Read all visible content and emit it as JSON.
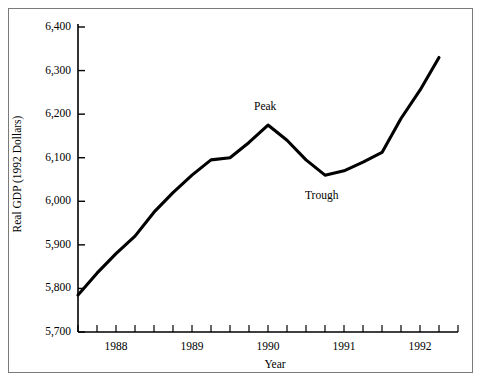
{
  "figure": {
    "border_color": "#7a7a7a",
    "background": "#ffffff",
    "line_color": "#000000"
  },
  "chart_data": {
    "type": "line",
    "title": "",
    "xlabel": "Year",
    "ylabel": "Real GDP (1992 Dollars)",
    "xlim": [
      1987.5,
      1992.5
    ],
    "ylim": [
      5700,
      6400
    ],
    "yticks": [
      5700,
      5800,
      5900,
      6000,
      6100,
      6200,
      6300,
      6400
    ],
    "ytick_labels": [
      "5,700",
      "5,800",
      "5,900",
      "6,000",
      "6,100",
      "6,200",
      "6,300",
      "6,400"
    ],
    "xticks": [
      1988,
      1989,
      1990,
      1991,
      1992
    ],
    "xtick_labels": [
      "1988",
      "1989",
      "1990",
      "1991",
      "1992"
    ],
    "minor_xticks_per_year": 4,
    "grid": false,
    "legend": null,
    "x": [
      1987.5,
      1987.75,
      1988.0,
      1988.25,
      1988.5,
      1988.75,
      1989.0,
      1989.25,
      1989.5,
      1989.75,
      1990.0,
      1990.25,
      1990.5,
      1990.75,
      1991.0,
      1991.25,
      1991.5,
      1991.75,
      1992.0,
      1992.25
    ],
    "values": [
      5785,
      5835,
      5880,
      5920,
      5975,
      6020,
      6060,
      6095,
      6100,
      6135,
      6175,
      6140,
      6095,
      6060,
      6070,
      6090,
      6112,
      6190,
      6255,
      6330
    ],
    "annotations": [
      {
        "label": "Peak",
        "x": 1990.0,
        "y": 6175
      },
      {
        "label": "Trough",
        "x": 1990.75,
        "y": 6060
      }
    ]
  }
}
